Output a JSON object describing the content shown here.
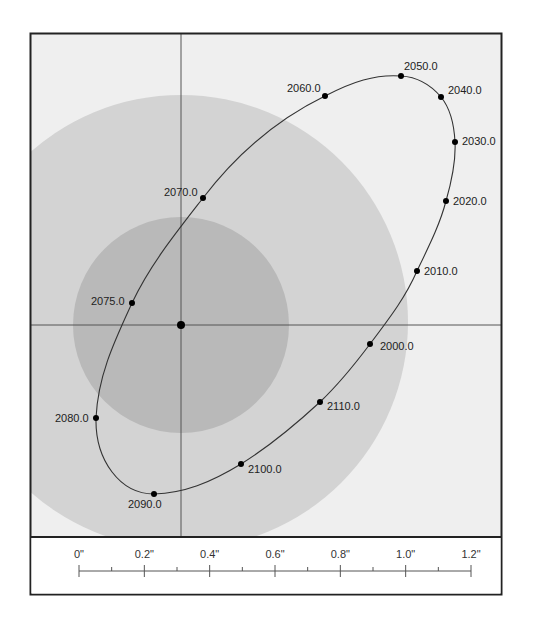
{
  "diagram": {
    "type": "binary-star-orbit",
    "colors": {
      "background": "#efefef",
      "outer_circle": "#d3d3d3",
      "inner_circle": "#b9b9b9",
      "frame": "#222222",
      "orbit": "#333333",
      "point": "#000000",
      "crosshair": "#555555",
      "scale_panel": "#ffffff"
    },
    "primary_star": {
      "label": "primary-star",
      "x": 181,
      "y": 325
    },
    "orbit_points": [
      {
        "label": "2000.0",
        "x": 370,
        "y": 344,
        "lx": 380,
        "ly": 350
      },
      {
        "label": "2010.0",
        "x": 417,
        "y": 271,
        "lx": 424,
        "ly": 275
      },
      {
        "label": "2020.0",
        "x": 446,
        "y": 201,
        "lx": 453,
        "ly": 205
      },
      {
        "label": "2030.0",
        "x": 455,
        "y": 142,
        "lx": 462,
        "ly": 145
      },
      {
        "label": "2040.0",
        "x": 441,
        "y": 97,
        "lx": 448,
        "ly": 94
      },
      {
        "label": "2050.0",
        "x": 401,
        "y": 76,
        "lx": 404,
        "ly": 70
      },
      {
        "label": "2060.0",
        "x": 325,
        "y": 96,
        "lx": 287,
        "ly": 92
      },
      {
        "label": "2070.0",
        "x": 203,
        "y": 198,
        "lx": 164,
        "ly": 196
      },
      {
        "label": "2075.0",
        "x": 132,
        "y": 303,
        "lx": 91,
        "ly": 305
      },
      {
        "label": "2080.0",
        "x": 96,
        "y": 418,
        "lx": 55,
        "ly": 422
      },
      {
        "label": "2090.0",
        "x": 154,
        "y": 494,
        "lx": 128,
        "ly": 508
      },
      {
        "label": "2100.0",
        "x": 241,
        "y": 464,
        "lx": 248,
        "ly": 473
      },
      {
        "label": "2110.0",
        "x": 320,
        "y": 402,
        "lx": 327,
        "ly": 410
      }
    ],
    "scale_bar": {
      "labels": [
        "0\"",
        "0.2\"",
        "0.4\"",
        "0.6\"",
        "0.8\"",
        "1.0\"",
        "1.2\""
      ],
      "unit": "arcseconds",
      "minor_ticks": 6
    }
  }
}
